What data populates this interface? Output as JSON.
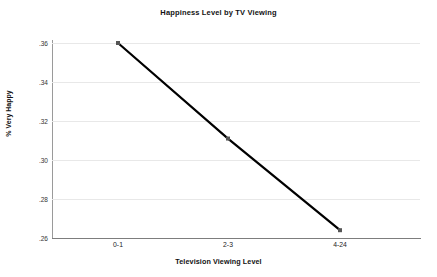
{
  "chart_data": {
    "type": "line",
    "title": "Happiness Level by TV Viewing",
    "xlabel": "Television Viewing Level",
    "ylabel": "% Very Happy",
    "categories": [
      "0-1",
      "2-3",
      "4-24"
    ],
    "values": [
      0.36,
      0.311,
      0.264
    ],
    "series": [
      {
        "name": "% Very Happy",
        "values": [
          0.36,
          0.311,
          0.264
        ]
      }
    ],
    "ylim": [
      0.26,
      0.36
    ],
    "yticks": [
      0.36,
      0.34,
      0.32,
      0.3,
      0.28,
      0.26
    ],
    "ytick_labels": [
      ".36",
      ".34",
      ".32",
      ".30",
      ".28",
      ".26"
    ],
    "xtick_labels": [
      "0-1",
      "2-3",
      "4-24"
    ],
    "grid": true,
    "grid_axis": "y",
    "legend": false,
    "markers": "square",
    "line_color": "#000000",
    "marker_color": "#555555",
    "grid_color": "#e8e8e8",
    "axis_color": "#8a8a8a",
    "background": "#ffffff"
  }
}
